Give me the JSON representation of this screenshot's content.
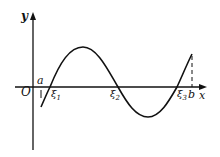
{
  "diagram": {
    "axes": {
      "x_label": "x",
      "y_label": "y",
      "origin_label": "O"
    },
    "interval": {
      "left_label": "a",
      "right_label": "b"
    },
    "roots": [
      {
        "label": "ξ",
        "subscript": "1"
      },
      {
        "label": "ξ",
        "subscript": "2"
      },
      {
        "label": "ξ",
        "subscript": "3"
      }
    ],
    "colors": {
      "stroke": "#111111",
      "background": "#ffffff"
    }
  }
}
